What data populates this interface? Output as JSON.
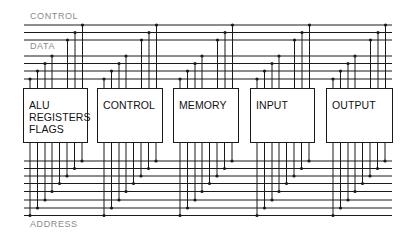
{
  "diagram": {
    "labels": {
      "control": "CONTROL",
      "data": "DATA",
      "address": "ADDRESS"
    },
    "buses": {
      "control_lines": [
        25,
        32.5,
        40
      ],
      "data_lines": [
        56,
        63.5,
        71,
        79
      ],
      "address_lines": [
        161,
        168.5,
        176,
        183.5,
        191.5,
        200,
        208,
        215.5
      ],
      "x_start": 24,
      "x_end": 392
    },
    "blocks": [
      {
        "id": "alu",
        "lines": [
          "ALU",
          "REGISTERS",
          "FLAGS"
        ],
        "left": 23,
        "right": 88
      },
      {
        "id": "control",
        "lines": [
          "CONTROL"
        ],
        "left": 97,
        "right": 163
      },
      {
        "id": "memory",
        "lines": [
          "MEMORY"
        ],
        "left": 173,
        "right": 239
      },
      {
        "id": "input",
        "lines": [
          "INPUT"
        ],
        "left": 250,
        "right": 315
      },
      {
        "id": "output",
        "lines": [
          "OUTPUT"
        ],
        "left": 326,
        "right": 393
      }
    ],
    "block_top": 88,
    "block_bottom": 143,
    "tap_offsets": {
      "data": [
        7,
        14.5,
        22,
        29
      ],
      "control": [
        44.5,
        52,
        59.5
      ],
      "address": [
        7,
        14.5,
        22,
        29,
        36.5,
        44,
        51.5,
        59
      ]
    },
    "colors": {
      "line": "#1a1a1a",
      "label": "#8a8a8a"
    }
  }
}
